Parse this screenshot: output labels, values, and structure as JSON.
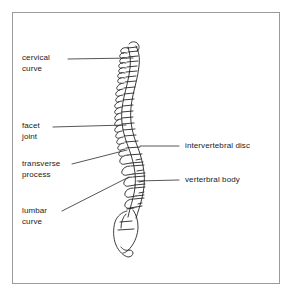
{
  "figure": {
    "width": 292,
    "height": 298,
    "background_color": "#ffffff",
    "frame_color": "#9a9a9a",
    "ink_color": "#1a1a1a",
    "leader_color": "#2b2b2b"
  },
  "labels": {
    "cervical_curve": {
      "line1": "cervical",
      "line2": "curve",
      "side": "left"
    },
    "facet_joint": {
      "line1": "facet",
      "line2": "joint",
      "side": "left"
    },
    "transverse_process": {
      "line1": "transverse",
      "line2": "process",
      "side": "left"
    },
    "lumbar_curve": {
      "line1": "lumbar",
      "line2": "curve",
      "side": "left"
    },
    "intervertebral_disc": {
      "line1": "intervertebral disc",
      "side": "right"
    },
    "vertebral_body": {
      "line1": "verterbral body",
      "side": "right"
    }
  }
}
